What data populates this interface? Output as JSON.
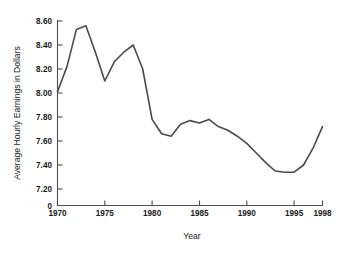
{
  "chart_data": {
    "type": "line",
    "title": "",
    "xlabel": "Year",
    "ylabel": "Average Hourly Earnings in Dollars",
    "xlim": [
      1970,
      1998
    ],
    "ylim": [
      7.1,
      8.62
    ],
    "grid": false,
    "legend": null,
    "axis_break_label": "0",
    "x_tick_labels": [
      "1970",
      "1975",
      "1980",
      "1985",
      "1990",
      "1995",
      "1998"
    ],
    "x_tick_values": [
      1970,
      1975,
      1980,
      1985,
      1990,
      1995,
      1998
    ],
    "y_tick_labels": [
      "8.60",
      "8.40",
      "8.20",
      "8.00",
      "7.80",
      "7.60",
      "7.40",
      "7.20"
    ],
    "y_tick_values": [
      8.6,
      8.4,
      8.2,
      8.0,
      7.8,
      7.6,
      7.4,
      7.2
    ],
    "line_color": "#4a4a4a",
    "x": [
      1970,
      1971,
      1972,
      1973,
      1974,
      1975,
      1976,
      1977,
      1978,
      1979,
      1980,
      1981,
      1982,
      1983,
      1984,
      1985,
      1986,
      1987,
      1988,
      1989,
      1990,
      1991,
      1992,
      1993,
      1994,
      1995,
      1996,
      1997,
      1998
    ],
    "values": [
      8.01,
      8.22,
      8.53,
      8.56,
      8.34,
      8.1,
      8.26,
      8.34,
      8.4,
      8.2,
      7.78,
      7.66,
      7.64,
      7.74,
      7.77,
      7.75,
      7.78,
      7.72,
      7.69,
      7.64,
      7.58,
      7.5,
      7.42,
      7.35,
      7.34,
      7.34,
      7.4,
      7.54,
      7.72
    ],
    "series": [
      {
        "name": "Average Hourly Earnings",
        "values": [
          8.01,
          8.22,
          8.53,
          8.56,
          8.34,
          8.1,
          8.26,
          8.34,
          8.4,
          8.2,
          7.78,
          7.66,
          7.64,
          7.74,
          7.77,
          7.75,
          7.78,
          7.72,
          7.69,
          7.64,
          7.58,
          7.5,
          7.42,
          7.35,
          7.34,
          7.34,
          7.4,
          7.54,
          7.72
        ]
      }
    ]
  }
}
